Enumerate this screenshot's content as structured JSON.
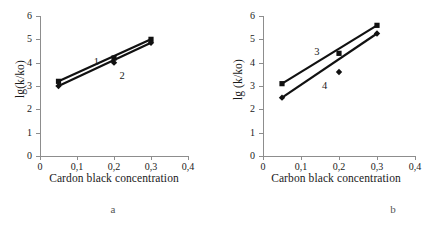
{
  "figure": {
    "panels": [
      {
        "caption": "a",
        "ylabel": "lg(k/ko)",
        "xlabel": "Cardon black concentration",
        "series_labels": [
          "1",
          "2"
        ]
      },
      {
        "caption": "b",
        "ylabel": "lg (k/ko)",
        "xlabel": "Carbon black concentration",
        "series_labels": [
          "3",
          "4"
        ]
      }
    ],
    "axis_color": "#8d8d8d",
    "data_color": "#111111"
  },
  "chart_data": [
    {
      "type": "line",
      "title": "a",
      "xlabel": "Cardon black concentration",
      "ylabel": "lg(k/ko)",
      "xlim": [
        0,
        0.4
      ],
      "ylim": [
        0,
        6
      ],
      "xticks": [
        0,
        0.1,
        0.2,
        0.3,
        0.4
      ],
      "xtick_labels": [
        "0",
        "0,1",
        "0,2",
        "0,3",
        "0,4"
      ],
      "yticks": [
        0,
        1,
        2,
        3,
        4,
        5,
        6
      ],
      "ytick_labels": [
        "0",
        "1",
        "2",
        "3",
        "4",
        "5",
        "6"
      ],
      "grid": false,
      "legend": "inline-annotations",
      "annotations": [
        {
          "text": "1",
          "x": 0.145,
          "y": 4.05
        },
        {
          "text": "2",
          "x": 0.215,
          "y": 3.45
        }
      ],
      "series": [
        {
          "name": "1",
          "marker": "square",
          "x": [
            0.05,
            0.2,
            0.3
          ],
          "values": [
            3.2,
            4.2,
            5.0
          ]
        },
        {
          "name": "2",
          "marker": "diamond",
          "x": [
            0.05,
            0.2,
            0.3
          ],
          "values": [
            3.0,
            4.0,
            4.85
          ]
        }
      ]
    },
    {
      "type": "line",
      "title": "b",
      "xlabel": "Carbon black concentration",
      "ylabel": "lg (k/ko)",
      "xlim": [
        0,
        0.4
      ],
      "ylim": [
        0,
        6
      ],
      "xticks": [
        0,
        0.1,
        0.2,
        0.3,
        0.4
      ],
      "xtick_labels": [
        "0",
        "0,1",
        "0,2",
        "0,3",
        "0,4"
      ],
      "yticks": [
        0,
        1,
        2,
        3,
        4,
        5,
        6
      ],
      "ytick_labels": [
        "0",
        "1",
        "2",
        "3",
        "4",
        "5",
        "6"
      ],
      "grid": false,
      "legend": "inline-annotations",
      "annotations": [
        {
          "text": "3",
          "x": 0.135,
          "y": 4.45
        },
        {
          "text": "4",
          "x": 0.155,
          "y": 3.0
        }
      ],
      "series": [
        {
          "name": "3",
          "marker": "square",
          "x": [
            0.05,
            0.2,
            0.3
          ],
          "values": [
            3.1,
            4.4,
            5.6
          ]
        },
        {
          "name": "4",
          "marker": "diamond",
          "x": [
            0.05,
            0.2,
            0.3
          ],
          "values": [
            2.5,
            3.6,
            5.25
          ]
        }
      ]
    }
  ]
}
